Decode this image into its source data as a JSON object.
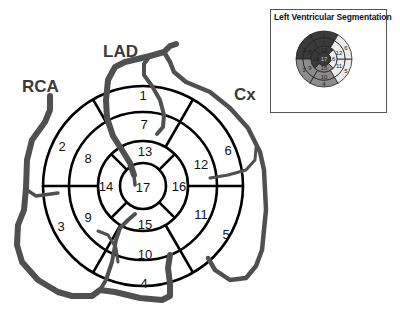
{
  "diagram": {
    "type": "bullseye-17-segment",
    "center": [
      143,
      186
    ],
    "radii": {
      "outer": 100,
      "mid": 74,
      "apical": 45,
      "apex": 23
    },
    "ring_colors": {
      "line": "#000000",
      "vessel": "#505050"
    }
  },
  "artery_labels": {
    "rca": "RCA",
    "lad": "LAD",
    "cx": "Cx"
  },
  "segments": {
    "basal": [
      "1",
      "6",
      "5",
      "4",
      "3",
      "2"
    ],
    "mid": [
      "7",
      "12",
      "11",
      "10",
      "9",
      "8"
    ],
    "apical": [
      "13",
      "16",
      "15",
      "14"
    ],
    "apex": "17"
  },
  "segment_labels": [
    {
      "id": "1",
      "x": 143,
      "y": 100
    },
    {
      "id": "2",
      "x": 62,
      "y": 146
    },
    {
      "id": "3",
      "x": 61,
      "y": 227
    },
    {
      "id": "4",
      "x": 144,
      "y": 286
    },
    {
      "id": "5",
      "x": 226,
      "y": 236
    },
    {
      "id": "6",
      "x": 228,
      "y": 152
    },
    {
      "id": "7",
      "x": 144,
      "y": 127
    },
    {
      "id": "8",
      "x": 88,
      "y": 160
    },
    {
      "id": "9",
      "x": 88,
      "y": 220
    },
    {
      "id": "10",
      "x": 145,
      "y": 258
    },
    {
      "id": "11",
      "x": 201,
      "y": 216
    },
    {
      "id": "12",
      "x": 201,
      "y": 166
    },
    {
      "id": "13",
      "x": 145,
      "y": 156
    },
    {
      "id": "14",
      "x": 106,
      "y": 190
    },
    {
      "id": "15",
      "x": 145,
      "y": 229
    },
    {
      "id": "16",
      "x": 179,
      "y": 190
    },
    {
      "id": "17",
      "x": 143,
      "y": 192
    }
  ],
  "inset": {
    "title": "Left Ventricular Segmentation",
    "center": [
      324,
      59
    ],
    "colors": {
      "lad": "#3a3a3a",
      "rca": "#8c8c8c",
      "cx": "#ececec",
      "line": "#222222"
    },
    "territories": {
      "lad": [
        "1",
        "2",
        "7",
        "8",
        "13",
        "14",
        "17"
      ],
      "rca": [
        "3",
        "4",
        "9",
        "10",
        "15"
      ],
      "cx": [
        "5",
        "6",
        "11",
        "12",
        "16"
      ]
    }
  }
}
